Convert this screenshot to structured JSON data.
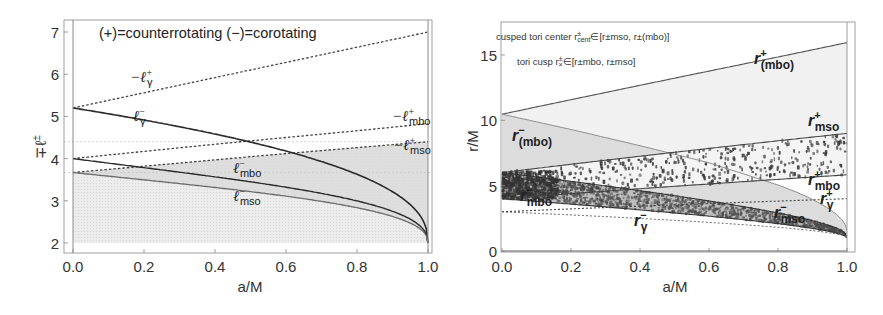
{
  "chart_data": [
    {
      "type": "line",
      "panel": "left",
      "title": "",
      "annotation": "(+)=counterrotating  (−)=corotating",
      "xlabel": "a/M",
      "ylabel": "∓ℓ±",
      "xlim": [
        0.0,
        1.0
      ],
      "ylim": [
        1.8,
        7.3
      ],
      "xticks": [
        "0.0",
        "0.2",
        "0.4",
        "0.6",
        "0.8",
        "1.0"
      ],
      "yticks": [
        "2",
        "3",
        "4",
        "5",
        "6",
        "7"
      ],
      "grid": false,
      "x": [
        0.0,
        0.2,
        0.4,
        0.6,
        0.8,
        1.0
      ],
      "series": [
        {
          "name": "−ℓγ+",
          "style": "dashed",
          "values": [
            5.2,
            5.56,
            5.92,
            6.28,
            6.64,
            7.0
          ]
        },
        {
          "name": "ℓγ−",
          "style": "solid-dark",
          "values": [
            5.2,
            4.76,
            4.29,
            3.77,
            3.16,
            2.0
          ]
        },
        {
          "name": "−ℓmbo+",
          "style": "dashed",
          "values": [
            4.0,
            4.17,
            4.34,
            4.5,
            4.66,
            4.83
          ]
        },
        {
          "name": "−ℓmso+",
          "style": "dashed",
          "values": [
            3.67,
            3.82,
            3.97,
            4.12,
            4.26,
            4.4
          ]
        },
        {
          "name": "ℓmbo−",
          "style": "solid-dark",
          "values": [
            4.0,
            3.79,
            3.55,
            3.27,
            2.91,
            2.0
          ]
        },
        {
          "name": "ℓmso−",
          "style": "solid-gray",
          "values": [
            3.67,
            3.5,
            3.31,
            3.08,
            2.8,
            2.0
          ]
        }
      ],
      "shaded_regions": [
        "below −ℓmso+ (light dotted gray)",
        "between ℓmso− and −ℓmbo+ band (gray)"
      ],
      "reference_lines": [
        4.4,
        3.67
      ]
    },
    {
      "type": "line",
      "panel": "right",
      "title": "",
      "annotations": [
        "cusped tori  center r±cent∈[r±mso, r±(mbo)]",
        "tori cusp r±×∈[r±mbo, r±mso]"
      ],
      "xlabel": "a/M",
      "ylabel": "r/M",
      "xlim": [
        0.0,
        1.0
      ],
      "ylim": [
        0,
        17
      ],
      "xticks": [
        "0.0",
        "0.2",
        "0.4",
        "0.6",
        "0.8",
        "1.0"
      ],
      "yticks": [
        "0",
        "5",
        "10",
        "15"
      ],
      "grid": false,
      "x": [
        0.0,
        0.2,
        0.4,
        0.6,
        0.8,
        1.0
      ],
      "series": [
        {
          "name": "r+(mbo)",
          "values": [
            10.47,
            11.58,
            12.68,
            13.77,
            14.85,
            15.95
          ]
        },
        {
          "name": "r−(mbo)",
          "values": [
            10.47,
            9.3,
            8.06,
            6.75,
            5.05,
            1.55
          ]
        },
        {
          "name": "r+mso",
          "values": [
            6.0,
            6.66,
            7.29,
            7.89,
            8.45,
            9.0
          ]
        },
        {
          "name": "r+mbo",
          "values": [
            4.0,
            4.39,
            4.77,
            5.13,
            5.48,
            5.83
          ]
        },
        {
          "name": "r+γ",
          "style": "dashed",
          "values": [
            3.0,
            3.22,
            3.44,
            3.63,
            3.83,
            4.0
          ]
        },
        {
          "name": "r−mso",
          "values": [
            6.0,
            5.33,
            4.61,
            3.83,
            2.91,
            1.0
          ]
        },
        {
          "name": "r−mbo",
          "values": [
            4.0,
            3.59,
            3.16,
            2.69,
            2.14,
            1.0
          ]
        },
        {
          "name": "r−γ",
          "style": "dashed",
          "values": [
            3.0,
            2.73,
            2.44,
            2.13,
            1.75,
            1.0
          ]
        }
      ],
      "shaded_regions": [
        "between r−mbo and r−mso (dense scatter)",
        "between r+mbo and r+mso (sparse scatter)",
        "below r+(mbo)/r−(mbo) (light gray)"
      ]
    }
  ],
  "left": {
    "annotation": "(+)=counterrotating  (−)=corotating",
    "xlabel": "a/M",
    "ylabel_main": "∓ℓ",
    "ylabel_sup": "±",
    "xticks": [
      "0.0",
      "0.2",
      "0.4",
      "0.6",
      "0.8",
      "1.0"
    ],
    "yticks": [
      "2",
      "3",
      "4",
      "5",
      "6",
      "7"
    ],
    "labels": {
      "lg_plus": {
        "pre": "−ℓ",
        "sup": "+",
        "sub": "γ"
      },
      "lg_minus": {
        "pre": "ℓ",
        "sup": "−",
        "sub": "γ"
      },
      "lmbo_plus": {
        "pre": "−ℓ",
        "sup": "+",
        "sub": "mbo"
      },
      "lmso_plus": {
        "pre": "−ℓ",
        "sup": "+",
        "sub": "mso"
      },
      "lmbo_minus": {
        "pre": "ℓ",
        "sup": "−",
        "sub": "mbo"
      },
      "lmso_minus": {
        "pre": "ℓ",
        "sup": "−",
        "sub": "mso"
      }
    }
  },
  "right": {
    "annotation1": "cusped tori  center r",
    "annotation1_sup": "±",
    "annotation1_sub": "cent",
    "annotation1_tail": "∈[r±mso, r±(mbo)]",
    "annotation2": "tori cusp r",
    "annotation2_sup": "±",
    "annotation2_sub": "×",
    "annotation2_tail": "∈[r±mbo, r±mso]",
    "xlabel": "a/M",
    "ylabel": "r/M",
    "xticks": [
      "0.0",
      "0.2",
      "0.4",
      "0.6",
      "0.8",
      "1.0"
    ],
    "yticks": [
      "0",
      "5",
      "10",
      "15"
    ],
    "labels": {
      "rmbo_p_plus": {
        "pre": "r",
        "sup": "+",
        "sub": "(mbo)"
      },
      "rmbo_p_minus": {
        "pre": "r",
        "sup": "−",
        "sub": "(mbo)"
      },
      "rmso_plus": {
        "pre": "r",
        "sup": "+",
        "sub": "mso"
      },
      "rmbo_plus": {
        "pre": "r",
        "sup": "+",
        "sub": "mbo"
      },
      "rg_plus": {
        "pre": "r",
        "sup": "+",
        "sub": "γ"
      },
      "rmbo_minus": {
        "pre": "r",
        "sup": "−",
        "sub": "mbo"
      },
      "rmso_minus": {
        "pre": "r",
        "sup": "−",
        "sub": "mso"
      },
      "rg_minus": {
        "pre": "r",
        "sup": "−",
        "sub": "γ"
      }
    }
  },
  "colors": {
    "frame": "#9a9a9a",
    "dark_line": "#2a2a2a",
    "gray_line": "#6a6a6a",
    "shade_light": "#e6e6e6",
    "shade_mid": "#d4d4d4",
    "dots": "#3a3a3a"
  }
}
